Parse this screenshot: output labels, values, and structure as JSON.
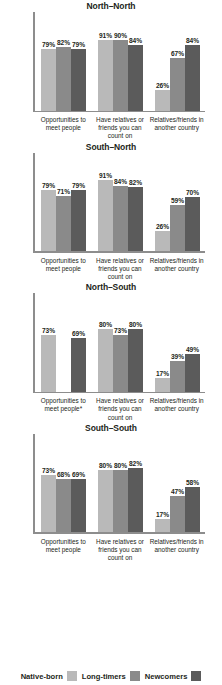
{
  "legend": {
    "items": [
      {
        "label": "Native-born",
        "color": "#b9b9b9"
      },
      {
        "label": "Long-timers",
        "color": "#8a8a8a"
      },
      {
        "label": "Newcomers",
        "color": "#5b5b5b"
      }
    ]
  },
  "chart_data": [
    {
      "type": "bar",
      "title": "North–North",
      "categories": [
        "Opportunities to meet people",
        "Have relatives or friends you can count on",
        "Relatives/friends in another country"
      ],
      "series": [
        {
          "name": "Native-born",
          "values": [
            79,
            91,
            26
          ]
        },
        {
          "name": "Long-timers",
          "values": [
            82,
            90,
            67
          ]
        },
        {
          "name": "Newcomers",
          "values": [
            79,
            84,
            84
          ]
        }
      ],
      "labels": [
        [
          "79%",
          "91%",
          "26%"
        ],
        [
          "82%",
          "90%",
          "67%"
        ],
        [
          "79%",
          "84%",
          "84%"
        ]
      ],
      "xlabel": "",
      "ylabel": "",
      "ylim": [
        0,
        100
      ],
      "grid": false,
      "legend_position": "bottom"
    },
    {
      "type": "bar",
      "title": "South–North",
      "categories": [
        "Opportunities to meet people",
        "Have relatives or friends you can count on",
        "Relatives/friends in another country"
      ],
      "series": [
        {
          "name": "Native-born",
          "values": [
            79,
            91,
            26
          ]
        },
        {
          "name": "Long-timers",
          "values": [
            71,
            84,
            59
          ]
        },
        {
          "name": "Newcomers",
          "values": [
            79,
            82,
            70
          ]
        }
      ],
      "labels": [
        [
          "79%",
          "91%",
          "26%"
        ],
        [
          "71%",
          "84%",
          "59%"
        ],
        [
          "79%",
          "82%",
          "70%"
        ]
      ],
      "xlabel": "",
      "ylabel": "",
      "ylim": [
        0,
        100
      ],
      "grid": false,
      "legend_position": "bottom"
    },
    {
      "type": "bar",
      "title": "North–South",
      "categories": [
        "Opportunities to meet people*",
        "Have relatives or friends you can count on",
        "Relatives/friends in another country"
      ],
      "series": [
        {
          "name": "Native-born",
          "values": [
            73,
            80,
            17
          ]
        },
        {
          "name": "Long-timers",
          "values": [
            null,
            73,
            39
          ]
        },
        {
          "name": "Newcomers",
          "values": [
            69,
            80,
            49
          ]
        }
      ],
      "labels": [
        [
          "73%",
          "80%",
          "17%"
        ],
        [
          "",
          "73%",
          "39%"
        ],
        [
          "69%",
          "80%",
          "49%"
        ]
      ],
      "xlabel": "",
      "ylabel": "",
      "ylim": [
        0,
        100
      ],
      "grid": false,
      "legend_position": "bottom"
    },
    {
      "type": "bar",
      "title": "South–South",
      "categories": [
        "Opportunities to meet people",
        "Have relatives or friends you can count on",
        "Relatives/friends in another country"
      ],
      "series": [
        {
          "name": "Native-born",
          "values": [
            73,
            80,
            17
          ]
        },
        {
          "name": "Long-timers",
          "values": [
            68,
            80,
            47
          ]
        },
        {
          "name": "Newcomers",
          "values": [
            69,
            82,
            58
          ]
        }
      ],
      "labels": [
        [
          "73%",
          "80%",
          "17%"
        ],
        [
          "68%",
          "80%",
          "47%"
        ],
        [
          "69%",
          "82%",
          "58%"
        ]
      ],
      "xlabel": "",
      "ylabel": "",
      "ylim": [
        0,
        100
      ],
      "grid": false,
      "legend_position": "bottom"
    }
  ]
}
